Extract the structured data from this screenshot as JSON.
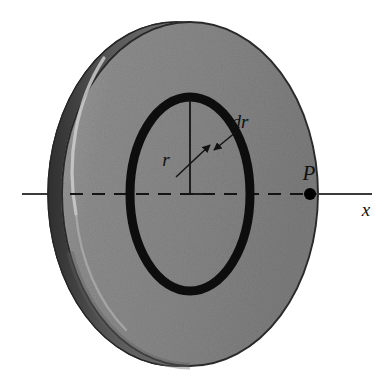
{
  "figure": {
    "background_color": "#ffffff",
    "labels": {
      "radius": "r",
      "ring_thickness": "dr",
      "field_point": "P",
      "axis": "x"
    },
    "colors": {
      "disk_face": "#8a8a8a",
      "disk_face_light": "#9a9a9a",
      "disk_face_dark": "#6f6f6f",
      "disk_edge_band": "#4a4a4a",
      "disk_highlight": "#c8c8c8",
      "disk_outline": "#2b2b2b",
      "ring_stroke": "#0d0d0d",
      "axis_line": "#3a3a3a",
      "point_marker": "#000000",
      "label_text": "#111111"
    },
    "geometry": {
      "disk_center_x": 190,
      "disk_center_y": 194,
      "disk_radius_x": 128,
      "disk_radius_y": 172,
      "disk_thickness_offset": 14,
      "ring_radius_x": 60,
      "ring_radius_y": 97,
      "ring_stroke_width": 9,
      "axis_y": 194,
      "axis_left_x": 22,
      "axis_right_x": 372,
      "point_p_x": 310,
      "point_p_radius": 6
    },
    "elements": {
      "disk_name": "charged-disk",
      "ring_name": "ring-element",
      "axis_name": "x-axis",
      "radius_line_name": "radius-line",
      "leader_name": "dr-leader-arrow",
      "point_name": "field-point-P"
    }
  }
}
